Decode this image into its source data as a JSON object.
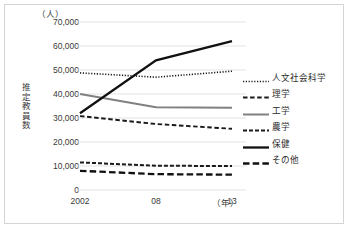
{
  "chart_data": {
    "type": "line",
    "title": "",
    "unit_label": "（人）",
    "ylabel": "推定教員数",
    "xlabel": "（年）",
    "categories": [
      "2002",
      "08",
      "13"
    ],
    "ylim": [
      0,
      70000
    ],
    "ytick_values": [
      70000,
      60000,
      50000,
      40000,
      30000,
      20000,
      10000,
      0
    ],
    "ytick_labels": [
      "70,000",
      "60,000",
      "50,000",
      "40,000",
      "30,000",
      "20,000",
      "10,000",
      "0"
    ],
    "grid": true,
    "legend_position": "right",
    "series": [
      {
        "name": "人文社会科学",
        "style": "dotted",
        "color": "#1a1a1a",
        "width": 1.6,
        "values": [
          48800,
          47000,
          49500
        ]
      },
      {
        "name": "理学",
        "style": "dashed-short",
        "color": "#1a1a1a",
        "width": 1.9,
        "values": [
          30800,
          27500,
          25500
        ]
      },
      {
        "name": "工学",
        "style": "solid",
        "color": "#808080",
        "width": 2.0,
        "values": [
          40000,
          34500,
          34300
        ]
      },
      {
        "name": "農学",
        "style": "dash-dot",
        "color": "#1a1a1a",
        "width": 2.0,
        "values": [
          11500,
          10100,
          10000
        ]
      },
      {
        "name": "保健",
        "style": "solid",
        "color": "#111111",
        "width": 2.3,
        "values": [
          32000,
          54000,
          62000
        ]
      },
      {
        "name": "その他",
        "style": "dashed-long",
        "color": "#111111",
        "width": 2.3,
        "values": [
          8000,
          6600,
          6400
        ]
      }
    ]
  },
  "legend": {
    "items": [
      {
        "label": "人文社会科学"
      },
      {
        "label": "理学"
      },
      {
        "label": "工学"
      },
      {
        "label": "農学"
      },
      {
        "label": "保健"
      },
      {
        "label": "その他"
      }
    ]
  },
  "colors": {
    "frame_border": "#d4d4d4",
    "gridline": "#e3e3e3",
    "text": "#3a3a3a",
    "gray_series": "#808080",
    "black_series": "#111111"
  }
}
